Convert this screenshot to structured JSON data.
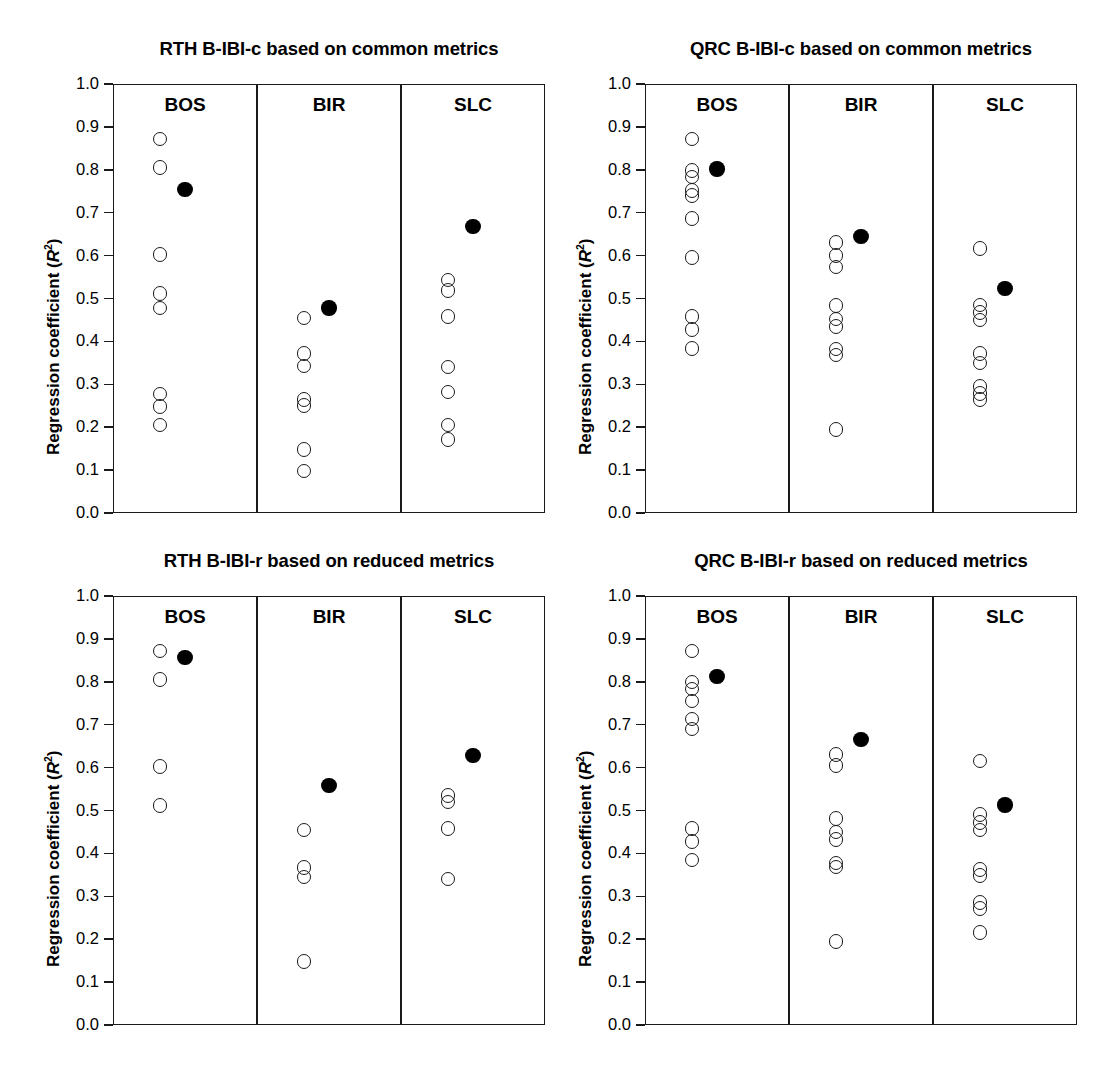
{
  "figure": {
    "axis": {
      "ylabel_prefix": "Regression coefficient (",
      "ylabel_symbol": "R",
      "ylabel_exponent": "2",
      "ylabel_suffix": ")",
      "tick_labels": [
        "1.0",
        "0.9",
        "0.8",
        "0.7",
        "0.6",
        "0.5",
        "0.4",
        "0.3",
        "0.2",
        "0.1",
        "0.0"
      ],
      "ymin": 0.0,
      "ymax": 1.0
    },
    "group_labels": [
      "BOS",
      "BIR",
      "SLC"
    ],
    "marker_colors": {
      "open_stroke": "#1a1a1a",
      "filled_fill": "#000000",
      "frame": "#1a1a1a"
    }
  },
  "chart_data": [
    {
      "type": "scatter",
      "title": "RTH B-IBI-c based on common metrics",
      "xlabel": "",
      "ylabel": "Regression coefficient (R2)",
      "ylim": [
        0.0,
        1.0
      ],
      "grid": false,
      "legend": "none",
      "categories": [
        "BOS",
        "BIR",
        "SLC"
      ],
      "series": [
        {
          "name": "open circles",
          "marker": "open",
          "groups": {
            "BOS": [
              0.872,
              0.805,
              0.602,
              0.512,
              0.478,
              0.277,
              0.248,
              0.205
            ],
            "BIR": [
              0.455,
              0.372,
              0.343,
              0.265,
              0.25,
              0.148,
              0.098
            ],
            "SLC": [
              0.543,
              0.518,
              0.458,
              0.34,
              0.282,
              0.205,
              0.172
            ]
          }
        },
        {
          "name": "filled circles",
          "marker": "filled",
          "groups": {
            "BOS": [
              0.755
            ],
            "BIR": [
              0.478
            ],
            "SLC": [
              0.667
            ]
          }
        }
      ]
    },
    {
      "type": "scatter",
      "title": "QRC B-IBI-c based on common metrics",
      "xlabel": "",
      "ylabel": "Regression coefficient (R2)",
      "ylim": [
        0.0,
        1.0
      ],
      "grid": false,
      "legend": "none",
      "categories": [
        "BOS",
        "BIR",
        "SLC"
      ],
      "series": [
        {
          "name": "open circles",
          "marker": "open",
          "groups": {
            "BOS": [
              0.872,
              0.798,
              0.783,
              0.752,
              0.74,
              0.687,
              0.596,
              0.458,
              0.428,
              0.383
            ],
            "BIR": [
              0.63,
              0.6,
              0.573,
              0.483,
              0.452,
              0.435,
              0.382,
              0.368,
              0.195
            ],
            "SLC": [
              0.617,
              0.485,
              0.468,
              0.45,
              0.372,
              0.35,
              0.295,
              0.278,
              0.265
            ]
          }
        },
        {
          "name": "filled circles",
          "marker": "filled",
          "groups": {
            "BOS": [
              0.802
            ],
            "BIR": [
              0.645
            ],
            "SLC": [
              0.523
            ]
          }
        }
      ]
    },
    {
      "type": "scatter",
      "title": "RTH B-IBI-r based on reduced metrics",
      "xlabel": "",
      "ylabel": "Regression coefficient (R2)",
      "ylim": [
        0.0,
        1.0
      ],
      "grid": false,
      "legend": "none",
      "categories": [
        "BOS",
        "BIR",
        "SLC"
      ],
      "series": [
        {
          "name": "open circles",
          "marker": "open",
          "groups": {
            "BOS": [
              0.872,
              0.805,
              0.602,
              0.512
            ],
            "BIR": [
              0.455,
              0.367,
              0.345,
              0.148
            ],
            "SLC": [
              0.535,
              0.52,
              0.458,
              0.34
            ]
          }
        },
        {
          "name": "filled circles",
          "marker": "filled",
          "groups": {
            "BOS": [
              0.857
            ],
            "BIR": [
              0.558
            ],
            "SLC": [
              0.628
            ]
          }
        }
      ]
    },
    {
      "type": "scatter",
      "title": "QRC B-IBI-r based on reduced metrics",
      "xlabel": "",
      "ylabel": "Regression coefficient (R2)",
      "ylim": [
        0.0,
        1.0
      ],
      "grid": false,
      "legend": "none",
      "categories": [
        "BOS",
        "BIR",
        "SLC"
      ],
      "series": [
        {
          "name": "open circles",
          "marker": "open",
          "groups": {
            "BOS": [
              0.872,
              0.8,
              0.783,
              0.755,
              0.713,
              0.69,
              0.458,
              0.428,
              0.385
            ],
            "BIR": [
              0.63,
              0.605,
              0.482,
              0.45,
              0.432,
              0.378,
              0.368,
              0.195
            ],
            "SLC": [
              0.615,
              0.49,
              0.472,
              0.455,
              0.362,
              0.348,
              0.285,
              0.272,
              0.215
            ]
          }
        },
        {
          "name": "filled circles",
          "marker": "filled",
          "groups": {
            "BOS": [
              0.812
            ],
            "BIR": [
              0.665
            ],
            "SLC": [
              0.513
            ]
          }
        }
      ]
    }
  ]
}
